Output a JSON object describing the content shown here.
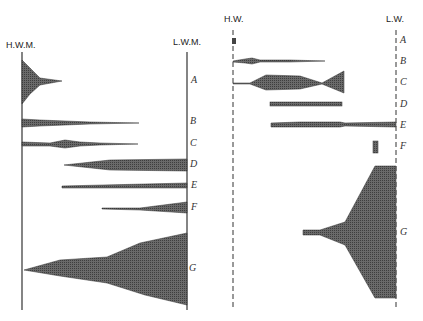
{
  "left_panel": {
    "top_left_label": "H.W.M.",
    "top_right_label": "L.W.M.",
    "rows": [
      "A",
      "B",
      "C",
      "D",
      "E",
      "F",
      "G"
    ]
  },
  "right_panel": {
    "top_left_label": "H.W.",
    "top_right_label": "L.W.",
    "rows": [
      "A",
      "B",
      "C",
      "D",
      "E",
      "F",
      "G"
    ]
  },
  "colors": {
    "fill": "#5a5a5a",
    "line": "#333333"
  }
}
